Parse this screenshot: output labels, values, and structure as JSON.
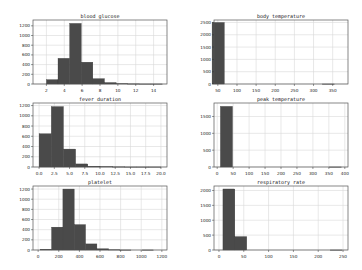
{
  "chart_data": [
    {
      "type": "bar",
      "title": "blood glucose",
      "xlabel": "",
      "ylabel": "",
      "xlim": [
        0.5,
        15.5
      ],
      "ylim": [
        0,
        1320
      ],
      "xticks": [
        2,
        4,
        6,
        8,
        10,
        12,
        14
      ],
      "yticks": [
        0,
        200,
        400,
        600,
        800,
        1000,
        1200
      ],
      "bin_edges": [
        2.0,
        3.3,
        4.6,
        5.9,
        7.2,
        8.5,
        9.8,
        11.1,
        12.4,
        13.7,
        15.0
      ],
      "values": [
        90,
        530,
        1250,
        450,
        110,
        30,
        8,
        3,
        1,
        1
      ],
      "grid": true
    },
    {
      "type": "bar",
      "title": "body temperature",
      "xlabel": "",
      "ylabel": "",
      "xlim": [
        40,
        390
      ],
      "ylim": [
        0,
        2600
      ],
      "xticks": [
        50,
        100,
        150,
        200,
        250,
        300,
        350
      ],
      "yticks": [
        0,
        500,
        1000,
        1500,
        2000,
        2500
      ],
      "bin_edges": [
        35.0,
        67.0,
        99.0,
        131.0,
        163.0,
        195.0,
        227.0,
        259.0,
        291.0,
        323.0,
        355.0
      ],
      "values": [
        2500,
        0,
        0,
        0,
        0,
        0,
        0,
        0,
        0,
        1
      ],
      "grid": true
    },
    {
      "type": "bar",
      "title": "fever duration",
      "xlabel": "",
      "ylabel": "",
      "xlim": [
        -1,
        21
      ],
      "ylim": [
        0,
        1250
      ],
      "xticks": [
        0.0,
        2.5,
        5.0,
        7.5,
        10.0,
        12.5,
        15.0,
        17.5,
        20.0
      ],
      "yticks": [
        0,
        200,
        400,
        600,
        800,
        1000,
        1200
      ],
      "bin_edges": [
        0,
        2,
        4,
        6,
        8,
        10,
        12,
        14,
        16,
        18,
        20
      ],
      "values": [
        650,
        1180,
        350,
        60,
        15,
        8,
        3,
        1,
        1,
        1
      ],
      "grid": true
    },
    {
      "type": "bar",
      "title": "peak temperature",
      "xlabel": "",
      "ylabel": "",
      "xlim": [
        -10,
        410
      ],
      "ylim": [
        0,
        1900
      ],
      "xticks": [
        0,
        50,
        100,
        150,
        200,
        250,
        300,
        350,
        400
      ],
      "yticks": [
        0,
        500,
        1000,
        1500
      ],
      "bin_edges": [
        10,
        48,
        86,
        124,
        162,
        200,
        238,
        276,
        314,
        352,
        390
      ],
      "values": [
        1800,
        0,
        0,
        0,
        0,
        0,
        0,
        0,
        0,
        1
      ],
      "grid": true
    },
    {
      "type": "bar",
      "title": "platelet",
      "xlabel": "",
      "ylabel": "",
      "xlim": [
        -50,
        1250
      ],
      "ylim": [
        0,
        1260
      ],
      "xticks": [
        0,
        200,
        400,
        600,
        800,
        1000,
        1200
      ],
      "yticks": [
        0,
        200,
        400,
        600,
        800,
        1000,
        1200
      ],
      "bin_edges": [
        20,
        130,
        240,
        350,
        460,
        570,
        680,
        790,
        900,
        1010,
        1120
      ],
      "values": [
        15,
        450,
        1200,
        500,
        120,
        25,
        5,
        1,
        0,
        1
      ],
      "grid": true
    },
    {
      "type": "bar",
      "title": "respiratory rate",
      "xlabel": "",
      "ylabel": "",
      "xlim": [
        -10,
        260
      ],
      "ylim": [
        0,
        2150
      ],
      "xticks": [
        0,
        50,
        100,
        150,
        200,
        250
      ],
      "yticks": [
        0,
        500,
        1000,
        1500,
        2000
      ],
      "bin_edges": [
        8,
        32,
        56,
        80,
        104,
        128,
        152,
        176,
        200,
        224,
        248
      ],
      "values": [
        2050,
        450,
        0,
        0,
        0,
        0,
        0,
        0,
        0,
        1
      ],
      "grid": true
    }
  ],
  "layout": {
    "rows": 3,
    "cols": 2,
    "bar_color": "#4a4a4a",
    "grid_color": "#d8d8d8",
    "frame_color": "#555555"
  }
}
